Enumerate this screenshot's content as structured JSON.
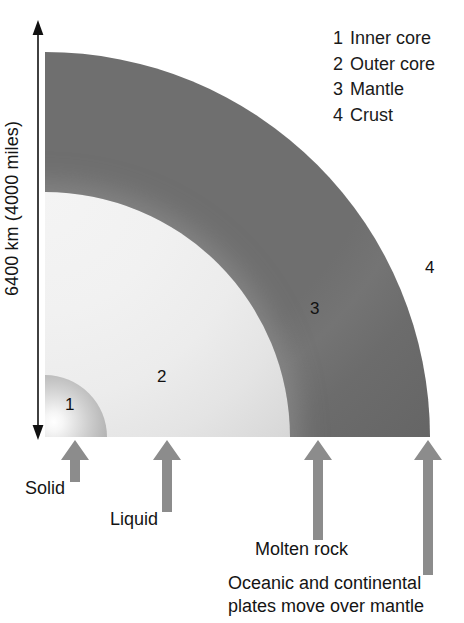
{
  "diagram": {
    "scale_label": "6400 km (4000 miles)",
    "legend": [
      {
        "number": "1",
        "label": "Inner core"
      },
      {
        "number": "2",
        "label": "Outer core"
      },
      {
        "number": "3",
        "label": "Mantle"
      },
      {
        "number": "4",
        "label": "Crust"
      }
    ],
    "markers": {
      "inner_core": "1",
      "outer_core": "2",
      "mantle": "3",
      "crust": "4"
    },
    "callouts": [
      {
        "name": "solid",
        "text": "Solid"
      },
      {
        "name": "liquid",
        "text": "Liquid"
      },
      {
        "name": "molten",
        "text": "Molten rock"
      },
      {
        "name": "plates",
        "text": "Oceanic and continental plates move over mantle"
      }
    ],
    "colors": {
      "crust": "#4a4a4a",
      "mantle": "#6f6f6f",
      "outer_core": "#ececec",
      "inner_core": "#bcbcbc",
      "arrow": "#8c8c8c",
      "axis": "#111111",
      "text": "#141414",
      "background": "#ffffff"
    }
  }
}
